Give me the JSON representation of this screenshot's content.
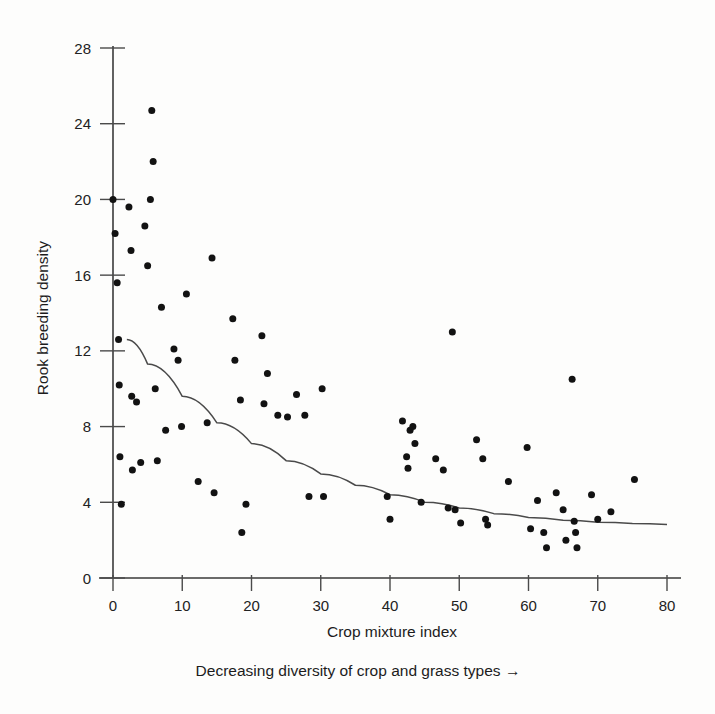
{
  "figure": {
    "background_color": "#fdfdfc",
    "ink_color": "#121212",
    "axis_color": "#3a3a3a"
  },
  "labels": {
    "y_axis_title": "Rook breeding density",
    "x_axis_title": "Crop mixture index",
    "sub_caption": "Decreasing diversity of crop and grass types →"
  },
  "chart_data": {
    "type": "scatter",
    "title": "",
    "xlabel": "Crop mixture index",
    "ylabel": "Rook breeding density",
    "sub_caption": "Decreasing diversity of crop and grass types →",
    "xlim": [
      0,
      80
    ],
    "ylim": [
      0,
      28
    ],
    "xticks": [
      0,
      10,
      20,
      30,
      40,
      50,
      60,
      70,
      80
    ],
    "yticks": [
      0,
      4,
      8,
      12,
      16,
      20,
      24,
      28
    ],
    "xtick_labels": [
      "0",
      "10",
      "20",
      "30",
      "40",
      "50",
      "60",
      "70",
      "80"
    ],
    "ytick_labels": [
      "0",
      "4",
      "8",
      "12",
      "16",
      "20",
      "24",
      "28"
    ],
    "grid": false,
    "legend": null,
    "marker": "filled-circle",
    "marker_color": "#121212",
    "marker_size_px": 7,
    "series": [
      {
        "name": "Rook breeding density vs crop mixture index",
        "points": [
          [
            0.0,
            20.0
          ],
          [
            0.3,
            18.2
          ],
          [
            0.6,
            15.6
          ],
          [
            0.8,
            12.6
          ],
          [
            0.9,
            10.2
          ],
          [
            1.0,
            6.4
          ],
          [
            1.2,
            3.9
          ],
          [
            2.3,
            19.6
          ],
          [
            2.6,
            17.3
          ],
          [
            2.7,
            9.6
          ],
          [
            2.8,
            5.7
          ],
          [
            3.4,
            9.3
          ],
          [
            4.0,
            6.1
          ],
          [
            4.6,
            18.6
          ],
          [
            5.0,
            16.5
          ],
          [
            5.4,
            20.0
          ],
          [
            5.6,
            24.7
          ],
          [
            5.8,
            22.0
          ],
          [
            6.1,
            10.0
          ],
          [
            6.4,
            6.2
          ],
          [
            7.0,
            14.3
          ],
          [
            7.6,
            7.8
          ],
          [
            8.8,
            12.1
          ],
          [
            9.4,
            11.5
          ],
          [
            9.9,
            8.0
          ],
          [
            10.6,
            15.0
          ],
          [
            12.3,
            5.1
          ],
          [
            13.6,
            8.2
          ],
          [
            14.3,
            16.9
          ],
          [
            14.6,
            4.5
          ],
          [
            17.3,
            13.7
          ],
          [
            17.6,
            11.5
          ],
          [
            18.4,
            9.4
          ],
          [
            18.6,
            2.4
          ],
          [
            19.2,
            3.9
          ],
          [
            21.5,
            12.8
          ],
          [
            21.8,
            9.2
          ],
          [
            22.3,
            10.8
          ],
          [
            23.8,
            8.6
          ],
          [
            25.2,
            8.5
          ],
          [
            26.5,
            9.7
          ],
          [
            27.7,
            8.6
          ],
          [
            28.3,
            4.3
          ],
          [
            30.2,
            10.0
          ],
          [
            30.4,
            4.3
          ],
          [
            39.6,
            4.3
          ],
          [
            40.0,
            3.1
          ],
          [
            41.8,
            8.3
          ],
          [
            42.4,
            6.4
          ],
          [
            42.6,
            5.8
          ],
          [
            42.9,
            7.8
          ],
          [
            43.3,
            8.0
          ],
          [
            43.6,
            7.1
          ],
          [
            44.5,
            4.0
          ],
          [
            46.6,
            6.3
          ],
          [
            47.7,
            5.7
          ],
          [
            48.4,
            3.7
          ],
          [
            49.0,
            13.0
          ],
          [
            49.4,
            3.6
          ],
          [
            50.2,
            2.9
          ],
          [
            52.5,
            7.3
          ],
          [
            53.4,
            6.3
          ],
          [
            53.8,
            3.1
          ],
          [
            54.1,
            2.8
          ],
          [
            57.1,
            5.1
          ],
          [
            59.8,
            6.9
          ],
          [
            60.3,
            2.6
          ],
          [
            61.3,
            4.1
          ],
          [
            62.2,
            2.4
          ],
          [
            62.6,
            1.6
          ],
          [
            64.0,
            4.5
          ],
          [
            65.0,
            3.6
          ],
          [
            65.4,
            2.0
          ],
          [
            66.3,
            10.5
          ],
          [
            66.6,
            3.0
          ],
          [
            66.8,
            2.4
          ],
          [
            67.0,
            1.6
          ],
          [
            69.1,
            4.4
          ],
          [
            70.0,
            3.1
          ],
          [
            71.9,
            3.5
          ],
          [
            75.3,
            5.2
          ]
        ]
      }
    ],
    "fit_curve": {
      "name": "fitted decline curve",
      "type": "exponential-decay",
      "points": [
        [
          2.0,
          12.6
        ],
        [
          5.0,
          11.3
        ],
        [
          10.0,
          9.6
        ],
        [
          15.0,
          8.2
        ],
        [
          20.0,
          7.1
        ],
        [
          25.0,
          6.2
        ],
        [
          30.0,
          5.5
        ],
        [
          35.0,
          4.9
        ],
        [
          40.0,
          4.4
        ],
        [
          45.0,
          4.0
        ],
        [
          50.0,
          3.7
        ],
        [
          55.0,
          3.4
        ],
        [
          60.0,
          3.2
        ],
        [
          65.0,
          3.05
        ],
        [
          70.0,
          2.95
        ],
        [
          75.0,
          2.88
        ],
        [
          80.0,
          2.83
        ]
      ]
    }
  }
}
